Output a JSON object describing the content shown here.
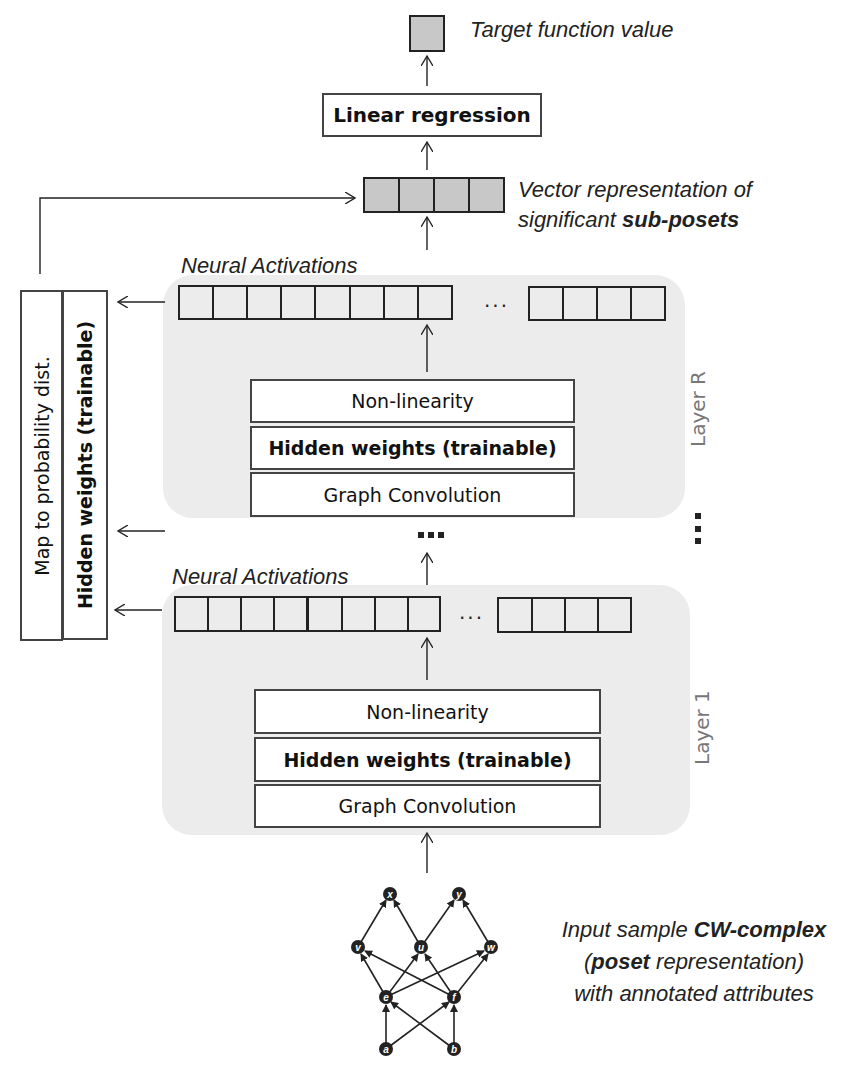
{
  "output": {
    "target_label": "Target function value",
    "linear_regression": "Linear regression",
    "vector_label_line1": "Vector representation of",
    "vector_label_line2_prefix": "significant ",
    "vector_label_line2_bold": "sub-posets"
  },
  "side_panel": {
    "map_label": "Map to probability dist.",
    "hidden_label": "Hidden weights (trainable)"
  },
  "layers": [
    {
      "name": "Layer R",
      "activations_label": "Neural Activations",
      "ellipsis": "...",
      "nonlinearity": "Non-linearity",
      "hidden_weights": "Hidden weights (trainable)",
      "graph_convolution": "Graph Convolution"
    },
    {
      "name": "Layer 1",
      "activations_label": "Neural Activations",
      "ellipsis": "...",
      "nonlinearity": "Non-linearity",
      "hidden_weights": "Hidden weights (trainable)",
      "graph_convolution": "Graph Convolution"
    }
  ],
  "input": {
    "line1_prefix": "Input sample ",
    "line1_bold": "CW-complex",
    "line2_open": "(",
    "line2_bold": "poset",
    "line2_rest": " representation)",
    "line3": "with annotated attributes",
    "graph_nodes": [
      "x",
      "y",
      "v",
      "u",
      "w",
      "e",
      "f",
      "a",
      "b"
    ]
  },
  "colors": {
    "layer_background": "#ececec",
    "filled_cell": "#c8c8c8",
    "stroke": "#222222",
    "layer_label": "#777777"
  }
}
